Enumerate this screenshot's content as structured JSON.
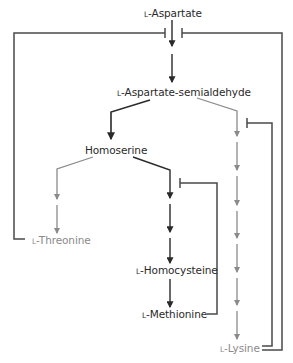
{
  "diagram": {
    "colors": {
      "main_path": "#2a2a2a",
      "branch_path": "#8a8a8a",
      "feedback": "#4a4a4a",
      "background": "#ffffff"
    },
    "nodes": {
      "aspartate": {
        "prefix": "L",
        "name": "-Aspartate"
      },
      "semialdehyde": {
        "prefix": "L",
        "name": "-Aspartate-semialdehyde"
      },
      "homoserine": {
        "prefix": "",
        "name": "Homoserine"
      },
      "threonine": {
        "prefix": "L",
        "name": "-Threonine"
      },
      "homocysteine": {
        "prefix": "L",
        "name": "-Homocysteine"
      },
      "methionine": {
        "prefix": "L",
        "name": "-Methionine"
      },
      "lysine": {
        "prefix": "L",
        "name": "-Lysine"
      }
    },
    "edges": [
      {
        "from": "L-Aspartate",
        "to": "L-Aspartate-semialdehyde",
        "steps": 2,
        "style": "black"
      },
      {
        "from": "L-Aspartate-semialdehyde",
        "to": "Homoserine",
        "steps": 1,
        "style": "black"
      },
      {
        "from": "L-Aspartate-semialdehyde",
        "to": "L-Lysine",
        "steps": 7,
        "style": "gray"
      },
      {
        "from": "Homoserine",
        "to": "L-Threonine",
        "steps": 2,
        "style": "gray"
      },
      {
        "from": "Homoserine",
        "to": "L-Homocysteine",
        "steps": 3,
        "style": "black"
      },
      {
        "from": "L-Homocysteine",
        "to": "L-Methionine",
        "steps": 1,
        "style": "black"
      }
    ],
    "inhibitions": [
      {
        "inhibitor": "L-Threonine",
        "target": "L-Aspartate step 1 (left bar)"
      },
      {
        "inhibitor": "L-Lysine",
        "target": "L-Aspartate step 1 (right bar)"
      },
      {
        "inhibitor": "L-Lysine",
        "target": "Lysine branch first step"
      },
      {
        "inhibitor": "L-Methionine",
        "target": "Methionine branch first step"
      }
    ]
  }
}
